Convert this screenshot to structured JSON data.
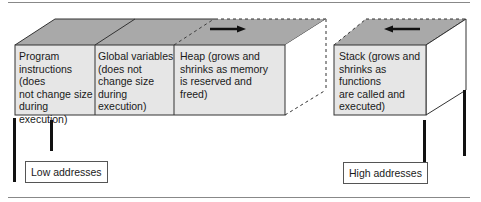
{
  "diagram": {
    "segments": [
      {
        "id": "program",
        "label": "Program instructions (does not change size during execution)",
        "lines": [
          "Program",
          "instructions (does",
          "not change size",
          "during execution)"
        ]
      },
      {
        "id": "globals",
        "label": "Global variables (does not change size during execution)",
        "lines": [
          "Global variables",
          "(does not",
          "change size",
          "during execution)"
        ]
      },
      {
        "id": "heap",
        "label": "Heap (grows and shrinks as memory is reserved and freed)",
        "lines": [
          "Heap (grows and",
          "shrinks as memory",
          "is reserved and",
          "freed)"
        ],
        "growth_direction": "right"
      },
      {
        "id": "stack",
        "label": "Stack (grows and shrinks as functions are called and executed)",
        "lines": [
          "Stack (grows and",
          "shrinks as functions",
          "are called and",
          "executed)"
        ],
        "growth_direction": "left"
      }
    ],
    "address_labels": {
      "low": "Low addresses",
      "high": "High addresses"
    },
    "colors": {
      "front_face": "#e6e6e6",
      "top_face": "#a9a9a9",
      "side_face": "#ffffff",
      "outline": "#333333",
      "arrow": "#111111"
    }
  }
}
